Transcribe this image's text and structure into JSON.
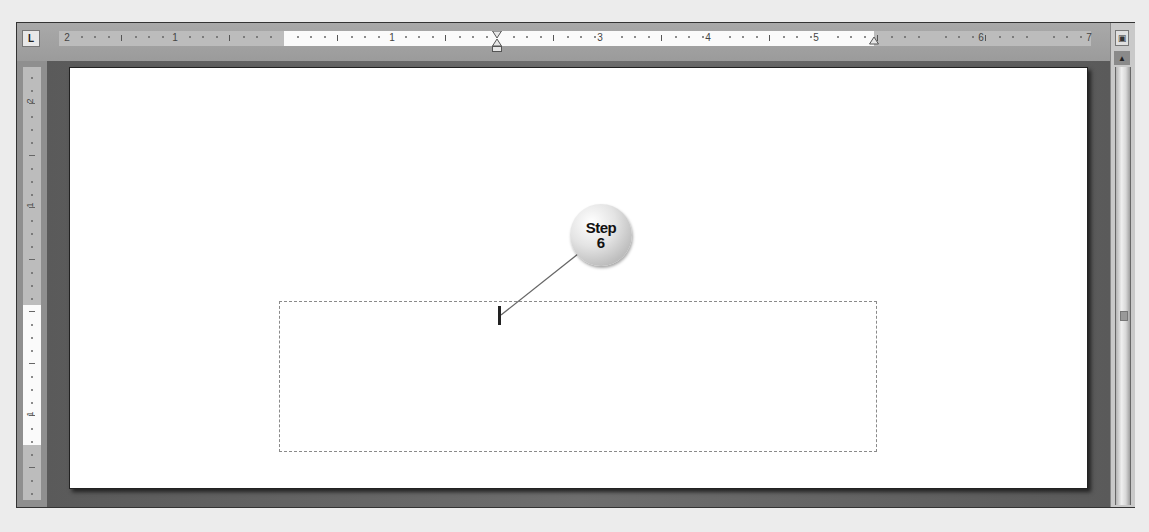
{
  "window": {
    "type": "word-processor-document-view"
  },
  "ruler_horizontal": {
    "tab_selector_icon": "left-tab-icon",
    "tab_selector_glyph": "L",
    "labels": [
      {
        "text": "2",
        "x": 8
      },
      {
        "text": "1",
        "x": 116
      },
      {
        "text": "1",
        "x": 333
      },
      {
        "text": "3",
        "x": 541
      },
      {
        "text": "4",
        "x": 649
      },
      {
        "text": "5",
        "x": 757
      },
      {
        "text": "6",
        "x": 922
      },
      {
        "text": "7",
        "x": 1030
      }
    ],
    "first_line_indent_marker_x": 438,
    "right_indent_marker_x": 815
  },
  "ruler_vertical": {
    "labels": [
      {
        "text": "2",
        "y": 29
      },
      {
        "text": "1",
        "y": 133
      },
      {
        "text": "1",
        "y": 342
      }
    ]
  },
  "document": {
    "text_box": {
      "content": ""
    },
    "callout": {
      "label": "Step",
      "number": "6",
      "colors": {
        "fill": "#e4e4e4",
        "text": "#111111"
      }
    }
  },
  "scrollbar": {
    "view_ruler_icon": "view-ruler-icon",
    "scroll_up_icon": "scroll-up-arrow-icon",
    "grip_icon": "scroll-grip-icon"
  },
  "colors": {
    "frame": "#8f8f8f",
    "page": "#ffffff",
    "ruler_margin": "#bcbcbc",
    "ruler_text_area": "#fafafa"
  }
}
